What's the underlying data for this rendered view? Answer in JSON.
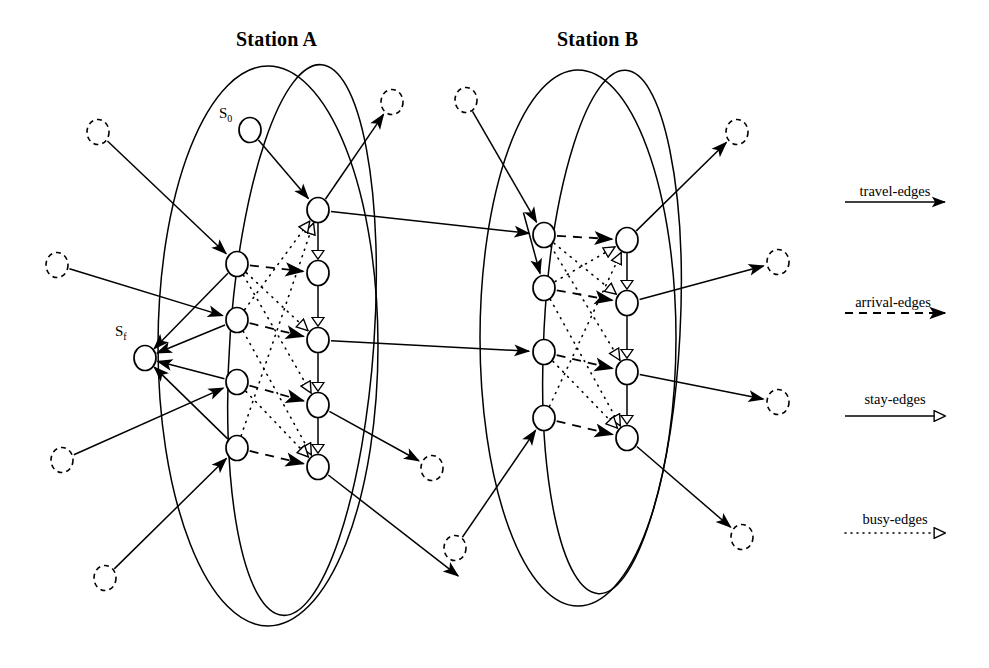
{
  "figure": {
    "kind": "time-expanded-station-network-diagram",
    "background": "#ffffff",
    "ink": "#000000"
  },
  "stations": [
    {
      "id": "station-a",
      "title": "Station A",
      "title_pos": {
        "x": 236,
        "y": 28
      },
      "ellipses": [
        {
          "cx": 268,
          "cy": 346,
          "rx": 110,
          "ry": 280,
          "rotate": 0
        },
        {
          "cx": 302,
          "cy": 340,
          "rx": 72,
          "ry": 276,
          "rotate": 4
        }
      ],
      "arrival_nodes": [
        {
          "id": "a-in-1",
          "x": 237,
          "y": 264
        },
        {
          "id": "a-in-2",
          "x": 237,
          "y": 320
        },
        {
          "id": "a-in-3",
          "x": 237,
          "y": 382
        },
        {
          "id": "a-in-4",
          "x": 237,
          "y": 448
        }
      ],
      "departure_nodes": [
        {
          "id": "a-out-1",
          "x": 318,
          "y": 210
        },
        {
          "id": "a-out-2",
          "x": 318,
          "y": 273
        },
        {
          "id": "a-out-3",
          "x": 318,
          "y": 340
        },
        {
          "id": "a-out-4",
          "x": 318,
          "y": 405
        },
        {
          "id": "a-out-5",
          "x": 318,
          "y": 467
        }
      ]
    },
    {
      "id": "station-b",
      "title": "Station B",
      "title_pos": {
        "x": 557,
        "y": 28
      },
      "ellipses": [
        {
          "cx": 578,
          "cy": 338,
          "rx": 98,
          "ry": 268,
          "rotate": 0
        },
        {
          "cx": 612,
          "cy": 332,
          "rx": 68,
          "ry": 262,
          "rotate": 3
        }
      ],
      "arrival_nodes": [
        {
          "id": "b-in-1",
          "x": 544,
          "y": 235
        },
        {
          "id": "b-in-2",
          "x": 544,
          "y": 288
        },
        {
          "id": "b-in-3",
          "x": 544,
          "y": 352
        },
        {
          "id": "b-in-4",
          "x": 544,
          "y": 418
        }
      ],
      "departure_nodes": [
        {
          "id": "b-out-1",
          "x": 627,
          "y": 240
        },
        {
          "id": "b-out-2",
          "x": 627,
          "y": 303
        },
        {
          "id": "b-out-3",
          "x": 627,
          "y": 372
        },
        {
          "id": "b-out-4",
          "x": 627,
          "y": 438
        }
      ]
    }
  ],
  "special_nodes": [
    {
      "id": "source",
      "label": "S",
      "sub": "0",
      "x": 250,
      "y": 130,
      "label_pos": {
        "x": 219,
        "y": 105
      }
    },
    {
      "id": "sink",
      "label": "S",
      "sub": "f",
      "x": 145,
      "y": 358,
      "label_pos": {
        "x": 115,
        "y": 323
      }
    }
  ],
  "external_nodes": [
    {
      "id": "ext-l1",
      "x": 98,
      "y": 132
    },
    {
      "id": "ext-l2",
      "x": 57,
      "y": 265
    },
    {
      "id": "ext-l3",
      "x": 62,
      "y": 460
    },
    {
      "id": "ext-l4",
      "x": 105,
      "y": 578
    },
    {
      "id": "ext-t1",
      "x": 392,
      "y": 102
    },
    {
      "id": "ext-t2",
      "x": 466,
      "y": 100
    },
    {
      "id": "ext-m1",
      "x": 432,
      "y": 468
    },
    {
      "id": "ext-m2",
      "x": 455,
      "y": 548
    },
    {
      "id": "ext-r1",
      "x": 737,
      "y": 132
    },
    {
      "id": "ext-r2",
      "x": 778,
      "y": 262
    },
    {
      "id": "ext-r3",
      "x": 778,
      "y": 402
    },
    {
      "id": "ext-r4",
      "x": 742,
      "y": 537
    }
  ],
  "edges": {
    "travel": [
      {
        "from": [
          318,
          210
        ],
        "to": [
          544,
          235
        ]
      },
      {
        "from": [
          318,
          340
        ],
        "to": [
          544,
          352
        ]
      },
      {
        "from": [
          627,
          240
        ],
        "to": [
          737,
          132
        ]
      },
      {
        "from": [
          627,
          303
        ],
        "to": [
          778,
          262
        ]
      },
      {
        "from": [
          627,
          372
        ],
        "to": [
          778,
          402
        ]
      },
      {
        "from": [
          627,
          438
        ],
        "to": [
          742,
          537
        ]
      },
      {
        "from": [
          318,
          210
        ],
        "to": [
          392,
          102
        ]
      },
      {
        "from": [
          318,
          405
        ],
        "to": [
          432,
          468
        ]
      },
      {
        "from": [
          318,
          467
        ],
        "to": [
          470,
          585
        ]
      },
      {
        "from": [
          98,
          132
        ],
        "to": [
          237,
          264
        ]
      },
      {
        "from": [
          57,
          265
        ],
        "to": [
          237,
          320
        ]
      },
      {
        "from": [
          62,
          460
        ],
        "to": [
          237,
          382
        ]
      },
      {
        "from": [
          105,
          578
        ],
        "to": [
          237,
          448
        ]
      },
      {
        "from": [
          466,
          100
        ],
        "to": [
          544,
          235
        ]
      },
      {
        "from": [
          455,
          548
        ],
        "to": [
          544,
          418
        ]
      },
      {
        "from": [
          520,
          200
        ],
        "to": [
          544,
          288
        ]
      },
      {
        "from": [
          250,
          130
        ],
        "to": [
          318,
          210
        ]
      }
    ],
    "to_sink": [
      {
        "from": [
          237,
          264
        ],
        "to": [
          145,
          358
        ]
      },
      {
        "from": [
          237,
          320
        ],
        "to": [
          145,
          358
        ]
      },
      {
        "from": [
          237,
          382
        ],
        "to": [
          145,
          358
        ]
      },
      {
        "from": [
          237,
          448
        ],
        "to": [
          145,
          358
        ]
      }
    ],
    "arrival": [
      {
        "from": [
          237,
          264
        ],
        "to": [
          318,
          273
        ]
      },
      {
        "from": [
          237,
          320
        ],
        "to": [
          318,
          340
        ]
      },
      {
        "from": [
          237,
          382
        ],
        "to": [
          318,
          405
        ]
      },
      {
        "from": [
          237,
          448
        ],
        "to": [
          318,
          467
        ]
      },
      {
        "from": [
          544,
          235
        ],
        "to": [
          627,
          240
        ]
      },
      {
        "from": [
          544,
          288
        ],
        "to": [
          627,
          303
        ]
      },
      {
        "from": [
          544,
          352
        ],
        "to": [
          627,
          372
        ]
      },
      {
        "from": [
          544,
          418
        ],
        "to": [
          627,
          438
        ]
      }
    ],
    "stay": [
      {
        "from": [
          318,
          210
        ],
        "to": [
          318,
          273
        ]
      },
      {
        "from": [
          318,
          273
        ],
        "to": [
          318,
          340
        ]
      },
      {
        "from": [
          318,
          340
        ],
        "to": [
          318,
          405
        ]
      },
      {
        "from": [
          318,
          405
        ],
        "to": [
          318,
          467
        ]
      },
      {
        "from": [
          627,
          240
        ],
        "to": [
          627,
          303
        ]
      },
      {
        "from": [
          627,
          303
        ],
        "to": [
          627,
          372
        ]
      },
      {
        "from": [
          627,
          372
        ],
        "to": [
          627,
          438
        ]
      }
    ],
    "busy": [
      {
        "from": [
          237,
          264
        ],
        "to": [
          318,
          340
        ]
      },
      {
        "from": [
          237,
          264
        ],
        "to": [
          318,
          405
        ]
      },
      {
        "from": [
          237,
          320
        ],
        "to": [
          318,
          467
        ]
      },
      {
        "from": [
          237,
          382
        ],
        "to": [
          318,
          467
        ]
      },
      {
        "from": [
          237,
          448
        ],
        "to": [
          318,
          210
        ]
      },
      {
        "from": [
          237,
          320
        ],
        "to": [
          318,
          210
        ]
      },
      {
        "from": [
          544,
          235
        ],
        "to": [
          627,
          303
        ]
      },
      {
        "from": [
          544,
          235
        ],
        "to": [
          627,
          372
        ]
      },
      {
        "from": [
          544,
          288
        ],
        "to": [
          627,
          438
        ]
      },
      {
        "from": [
          544,
          352
        ],
        "to": [
          627,
          438
        ]
      },
      {
        "from": [
          544,
          418
        ],
        "to": [
          627,
          240
        ]
      },
      {
        "from": [
          544,
          288
        ],
        "to": [
          627,
          240
        ]
      }
    ]
  },
  "legend": {
    "x_line_start": 845,
    "x_line_end": 945,
    "items": [
      {
        "id": "travel-edges",
        "label": "travel-edges",
        "style": "solid",
        "head": "filled",
        "label_x": 895,
        "label_y": 183,
        "line_y": 202
      },
      {
        "id": "arrival-edges",
        "label": "arrival-edges",
        "style": "dashed",
        "head": "filled",
        "label_x": 893,
        "label_y": 294,
        "line_y": 313
      },
      {
        "id": "stay-edges",
        "label": "stay-edges",
        "style": "solid",
        "head": "hollow",
        "label_x": 895,
        "label_y": 391,
        "line_y": 416
      },
      {
        "id": "busy-edges",
        "label": "busy-edges",
        "style": "dotted",
        "head": "hollow",
        "label_x": 895,
        "label_y": 511,
        "line_y": 533
      }
    ]
  }
}
